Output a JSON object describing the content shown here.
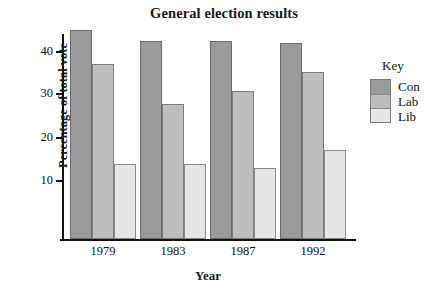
{
  "chart_data": {
    "type": "bar",
    "title": "General election results",
    "xlabel": "Year",
    "ylabel": "Percentage of total vote",
    "categories": [
      "1979",
      "1983",
      "1987",
      "1992"
    ],
    "series": [
      {
        "name": "Con",
        "color": "#9a9a9a",
        "values": [
          44.9,
          42.4,
          42.3,
          41.9
        ]
      },
      {
        "name": "Lab",
        "color": "#bdbdbd",
        "values": [
          36.9,
          27.6,
          30.8,
          35.2
        ]
      },
      {
        "name": "Lib",
        "color": "#e6e6e6",
        "values": [
          13.8,
          13.8,
          12.8,
          17.0
        ]
      }
    ],
    "ylim": [
      0,
      46
    ],
    "yticks": [
      10,
      20,
      30,
      40
    ],
    "ytick_labels": [
      "10",
      "20",
      "30",
      "40"
    ],
    "grid": false,
    "legend": {
      "title": "Key",
      "position": "right",
      "entries": [
        "Con",
        "Lab",
        "Lib"
      ]
    }
  }
}
